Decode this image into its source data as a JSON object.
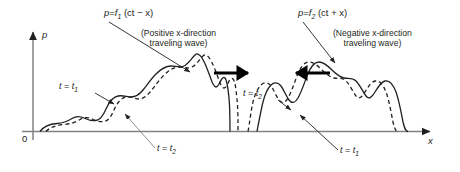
{
  "figure": {
    "title_absent": true,
    "axes": {
      "y_label": "p",
      "x_label": "x",
      "origin_label": "0",
      "axis_color": "#808285",
      "arrow_color": "#231f20"
    },
    "annotations": {
      "left_equation_p": "p",
      "left_equation_eq": "=",
      "left_equation_f": "f",
      "left_equation_sub": "1",
      "left_equation_arg": "(ct − x)",
      "left_equation_full": "p = f1 (ct − x)",
      "left_caption_line1": "(Positive x-direction",
      "left_caption_line2": "traveling wave)",
      "right_equation_p": "p",
      "right_equation_eq": "=",
      "right_equation_f": "f",
      "right_equation_sub": "2",
      "right_equation_arg": "(ct + x)",
      "right_equation_full": "p = f2 (ct + x)",
      "right_caption_line1": "(Negative x-direction",
      "right_caption_line2": "traveling wave)",
      "t_label_prefix": "t",
      "t_label_eq": "=",
      "t_label_t": "t",
      "t1_sub": "1",
      "t2_sub": "2",
      "left_upper_t": "t = t1",
      "left_lower_t": "t = t2",
      "mid_t": "t = t2",
      "right_lower_t": "t = t1"
    },
    "curves": {
      "solid_color": "#231f20",
      "dashed_color": "#231f20",
      "solid_width": 1.3,
      "dashed_width": 1.3,
      "dash_pattern": "4,3"
    },
    "direction_arrows": {
      "left_arrow_direction": "right",
      "right_arrow_direction": "left",
      "color": "#000000"
    }
  }
}
